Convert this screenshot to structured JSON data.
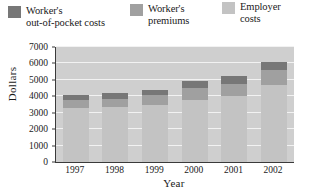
{
  "chart_data": {
    "type": "bar",
    "subtype": "stacked-bar",
    "title": "",
    "xlabel": "Year",
    "ylabel": "Dollars",
    "categories": [
      "1997",
      "1998",
      "1999",
      "2000",
      "2001",
      "2002"
    ],
    "ylim": [
      0,
      7000
    ],
    "yticks": [
      0,
      1000,
      2000,
      3000,
      4000,
      5000,
      6000,
      7000
    ],
    "ytick_labels": [
      "0",
      "1000",
      "2000",
      "3000",
      "4000",
      "5000",
      "6000",
      "7000"
    ],
    "grid": true,
    "grid_axis": "y",
    "legend_position": "top",
    "stack_order": [
      "Employer costs",
      "Worker's premiums",
      "Worker's out-of-pocket costs"
    ],
    "series": [
      {
        "name": "Employer costs",
        "color": "#c3c3c3",
        "values": [
          3300,
          3350,
          3450,
          3800,
          4000,
          4700
        ]
      },
      {
        "name": "Worker's premiums",
        "color": "#a0a0a0",
        "values": [
          480,
          500,
          600,
          700,
          750,
          900
        ]
      },
      {
        "name": "Worker's out-of-pocket costs",
        "color": "#777777",
        "values": [
          320,
          350,
          350,
          450,
          500,
          500
        ]
      }
    ],
    "totals": [
      4100,
      4200,
      4400,
      4950,
      5250,
      6100
    ]
  },
  "legend": {
    "items": [
      {
        "label": "Worker's\nout-of-pocket costs",
        "swatch": "#777777"
      },
      {
        "label": "Worker's\npremiums",
        "swatch": "#a0a0a0"
      },
      {
        "label": "Employer\ncosts",
        "swatch": "#c3c3c3"
      }
    ]
  },
  "axes": {
    "y_title": "Dollars",
    "x_title": "Year",
    "plot_background": "#cfcfcf",
    "gridline_color": "#f2f2f2",
    "axis_color": "#3a3a3a"
  }
}
